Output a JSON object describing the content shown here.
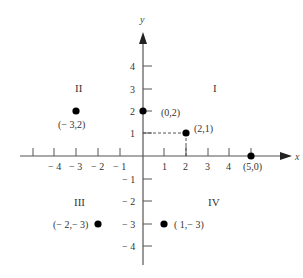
{
  "diagram": {
    "type": "cartesian-plane",
    "axes": {
      "x_label": "x",
      "y_label": "y",
      "x_ticks": [
        {
          "value": -4,
          "label": "− 4"
        },
        {
          "value": -3,
          "label": "− 3"
        },
        {
          "value": -2,
          "label": "− 2"
        },
        {
          "value": -1,
          "label": "− 1"
        },
        {
          "value": 1,
          "label": "1"
        },
        {
          "value": 2,
          "label": "2"
        },
        {
          "value": 3,
          "label": "3"
        },
        {
          "value": 4,
          "label": "4"
        },
        {
          "value": 5,
          "label": ""
        }
      ],
      "y_ticks": [
        {
          "value": 4,
          "label": "4"
        },
        {
          "value": 3,
          "label": "3"
        },
        {
          "value": 2,
          "label": "2"
        },
        {
          "value": 1,
          "label": "1"
        },
        {
          "value": -1,
          "label": "− 1"
        },
        {
          "value": -2,
          "label": "− 2"
        },
        {
          "value": -3,
          "label": "− 3"
        },
        {
          "value": -4,
          "label": "− 4"
        }
      ]
    },
    "quadrants": [
      {
        "id": "I",
        "label": "I"
      },
      {
        "id": "II",
        "label": "II"
      },
      {
        "id": "III",
        "label": "III"
      },
      {
        "id": "IV",
        "label": "IV"
      }
    ],
    "points": [
      {
        "x": -3,
        "y": 2,
        "label": "(− 3,2)"
      },
      {
        "x": 0,
        "y": 2,
        "label": "(0,2)"
      },
      {
        "x": 2,
        "y": 1,
        "label": "(2,1)",
        "dashed_projection": true
      },
      {
        "x": 5,
        "y": 0,
        "label": "(5,0)"
      },
      {
        "x": -2,
        "y": -3,
        "label": "(− 2,− 3)"
      },
      {
        "x": 1,
        "y": -3,
        "label": "( 1,− 3)"
      }
    ],
    "colors": {
      "axis": "#555555",
      "point": "#000000",
      "text": "#333333"
    }
  }
}
